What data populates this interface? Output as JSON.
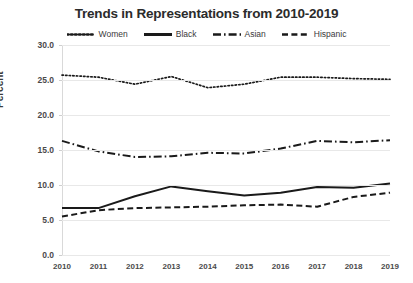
{
  "chart_data": {
    "type": "line",
    "title": "Trends in Representations from 2010-2019",
    "xlabel": "",
    "ylabel": "Percent",
    "categories": [
      "2010",
      "2011",
      "2012",
      "2013",
      "2014",
      "2015",
      "2016",
      "2017",
      "2018",
      "2019"
    ],
    "ylim": [
      0.0,
      30.0
    ],
    "ytick_labels": [
      "0.0",
      "5.0",
      "10.0",
      "15.0",
      "20.0",
      "25.0",
      "30.0"
    ],
    "ytick_values": [
      0.0,
      5.0,
      10.0,
      15.0,
      20.0,
      25.0,
      30.0
    ],
    "grid": "horizontal",
    "legend_position": "top-center",
    "series": [
      {
        "name": "Women",
        "style": "dotted",
        "color": "#1a1a1a",
        "values": [
          25.7,
          25.4,
          24.4,
          25.5,
          23.9,
          24.4,
          25.4,
          25.4,
          25.2,
          25.1
        ]
      },
      {
        "name": "Black",
        "style": "solid",
        "color": "#1a1a1a",
        "values": [
          6.7,
          6.7,
          8.4,
          9.8,
          9.1,
          8.5,
          8.9,
          9.7,
          9.6,
          10.2
        ]
      },
      {
        "name": "Asian",
        "style": "dashdot",
        "color": "#1a1a1a",
        "values": [
          16.3,
          14.8,
          14.0,
          14.1,
          14.6,
          14.5,
          15.2,
          16.3,
          16.1,
          16.4
        ]
      },
      {
        "name": "Hispanic",
        "style": "dashed",
        "color": "#1a1a1a",
        "values": [
          5.5,
          6.4,
          6.7,
          6.8,
          6.9,
          7.1,
          7.2,
          6.9,
          8.3,
          8.9
        ]
      }
    ]
  }
}
